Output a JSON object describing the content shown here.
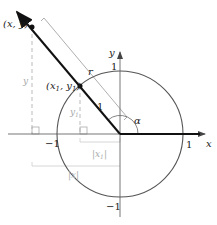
{
  "diagram": {
    "colors": {
      "ray": "#111111",
      "circle": "#555555",
      "axes": "#777777",
      "guides": "#bbbbbb"
    },
    "labels": {
      "point_outer": "(x, y)",
      "point_inner_x": "(x",
      "point_inner_sub1": "1",
      "point_inner_mid": ", y",
      "point_inner_sub2": "1",
      "point_inner_close": ")",
      "r": "r",
      "unit_segment": "1",
      "angle": "α",
      "axis_x": "x",
      "axis_y": "y",
      "tick_x_pos": "1",
      "tick_x_neg": "−1",
      "tick_y_pos": "1",
      "tick_y_neg": "−1",
      "vert_y": "y",
      "vert_y1": "y",
      "vert_y1_sub": "1",
      "abs_x1": "|x",
      "abs_x1_sub": "1",
      "abs_x1_close": "|",
      "abs_x": "|x|"
    }
  }
}
